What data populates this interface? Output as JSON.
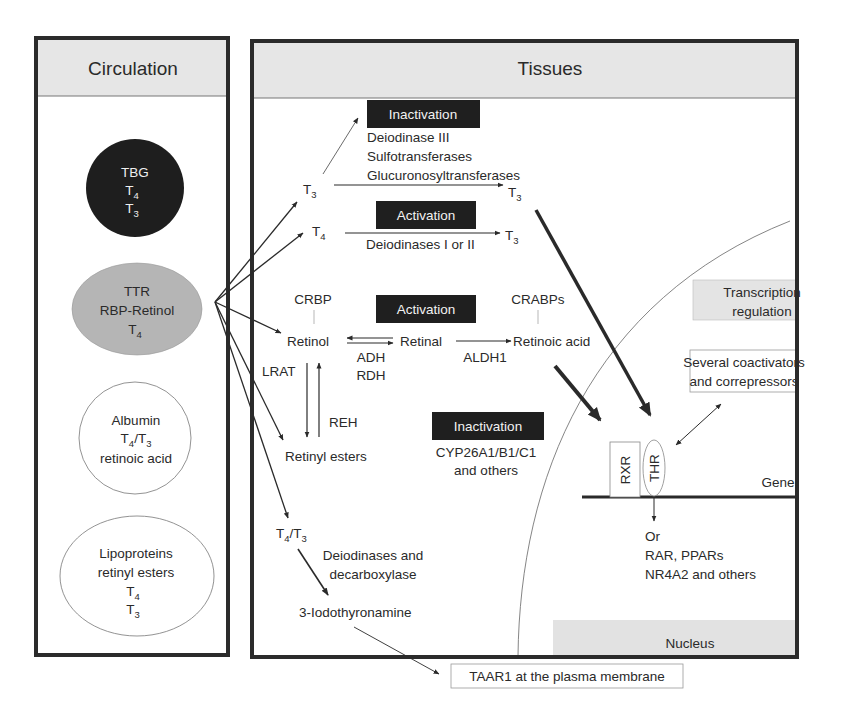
{
  "circulation": {
    "title": "Circulation",
    "carriers": [
      {
        "name": "TBG",
        "lines": [
          "TBG",
          "T4",
          "T3"
        ],
        "fill": "#1e1e1e"
      },
      {
        "name": "TTR",
        "lines": [
          "TTR",
          "RBP-Retinol",
          "T4"
        ],
        "fill": "#b5b5b5"
      },
      {
        "name": "Albumin",
        "lines": [
          "Albumin",
          "T4/T3",
          "retinoic acid"
        ],
        "fill": "#ffffff"
      },
      {
        "name": "Lipoproteins",
        "lines": [
          "Lipoproteins",
          "retinyl esters",
          "T4",
          "T3"
        ],
        "fill": "#ffffff"
      }
    ]
  },
  "tissues": {
    "title": "Tissues",
    "thyroid": {
      "inactivation_label": "Inactivation",
      "inactivation_enzymes": [
        "Deiodinase III",
        "Sulfotransferases",
        "Glucuronosyltransferases"
      ],
      "activation_label": "Activation",
      "activation_enzymes": "Deiodinases I or II",
      "t3_in": "T3",
      "t4_in": "T4",
      "t3_out_a": "T3",
      "t3_out_b": "T3"
    },
    "retinoid": {
      "activation_label": "Activation",
      "crbp": "CRBP",
      "crabps": "CRABPs",
      "retinol": "Retinol",
      "retinal": "Retinal",
      "retinoic_acid": "Retinoic acid",
      "adh": "ADH",
      "rdh": "RDH",
      "aldh1": "ALDH1",
      "lrat": "LRAT",
      "reh": "REH",
      "retinyl_esters": "Retinyl esters",
      "inactivation_label": "Inactivation",
      "inactivation_enzymes": [
        "CYP26A1/B1/C1",
        "and others"
      ]
    },
    "amine": {
      "source": "T4/T3",
      "enzymes": [
        "Deiodinases and",
        "decarboxylase"
      ],
      "product": "3-Iodothyronamine",
      "target": "TAAR1 at the plasma membrane"
    },
    "nucleus": {
      "label": "Nucleus",
      "transcription": [
        "Transcription",
        "regulation"
      ],
      "coregulators": [
        "Several coactivators",
        "and correpressors"
      ],
      "rxr": "RXR",
      "thr": "THR",
      "gene": "Gene",
      "alternatives": [
        "Or",
        "RAR, PPARs",
        "NR4A2 and others"
      ]
    }
  },
  "colors": {
    "border": "#2b2b2b",
    "header_fill": "#e6e6e6",
    "label_box": "#1f1f1f",
    "tbg": "#1e1e1e",
    "ttr": "#b5b5b5"
  }
}
